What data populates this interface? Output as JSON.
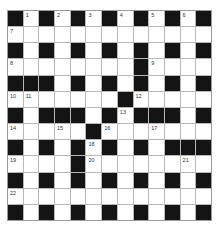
{
  "puzzle": {
    "type": "crossword",
    "rows": 13,
    "cols": 13,
    "layout": [
      "#.#.#.#.#.#.#",
      ".............",
      "#.#.#.#.#.#.#",
      "........#....",
      "###.#.#.#.#.#",
      ".......#.....",
      "#.###.#.###.#",
      ".....#.......",
      "#.#.#.#.#.###",
      "....#........",
      "#.#.#.#.#.#.#",
      ".............",
      "#.#.#.#.#.#.#"
    ],
    "numbers": [
      {
        "row": 0,
        "col": 1,
        "n": "1"
      },
      {
        "row": 0,
        "col": 3,
        "n": "2"
      },
      {
        "row": 0,
        "col": 5,
        "n": "3"
      },
      {
        "row": 0,
        "col": 7,
        "n": "4"
      },
      {
        "row": 0,
        "col": 9,
        "n": "5"
      },
      {
        "row": 0,
        "col": 11,
        "n": "6"
      },
      {
        "row": 1,
        "col": 0,
        "n": "7"
      },
      {
        "row": 3,
        "col": 0,
        "n": "8"
      },
      {
        "row": 3,
        "col": 9,
        "n": "9"
      },
      {
        "row": 5,
        "col": 0,
        "n": "10"
      },
      {
        "row": 5,
        "col": 1,
        "n": "11"
      },
      {
        "row": 5,
        "col": 8,
        "n": "12"
      },
      {
        "row": 6,
        "col": 7,
        "n": "13"
      },
      {
        "row": 7,
        "col": 0,
        "n": "14"
      },
      {
        "row": 7,
        "col": 3,
        "n": "15"
      },
      {
        "row": 7,
        "col": 6,
        "n": "16"
      },
      {
        "row": 7,
        "col": 9,
        "n": "17"
      },
      {
        "row": 8,
        "col": 5,
        "n": "18"
      },
      {
        "row": 9,
        "col": 0,
        "n": "19"
      },
      {
        "row": 9,
        "col": 5,
        "n": "20"
      },
      {
        "row": 9,
        "col": 11,
        "n": "21"
      },
      {
        "row": 11,
        "col": 0,
        "n": "22"
      }
    ],
    "colors": {
      "black_cell": "#141414",
      "white_cell": "#ffffff",
      "grid_line": "#b8b8b8"
    }
  }
}
